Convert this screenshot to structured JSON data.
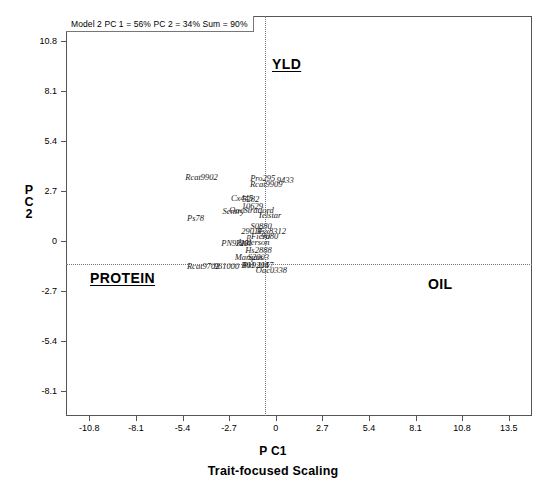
{
  "figure": {
    "model_annotation": "Model 2 PC 1 = 56% PC 2 = 34% Sum = 90%",
    "xlabel": "P C1",
    "scaling_label": "Trait-focused Scaling",
    "ylabel_line1": "P",
    "ylabel_line2": "C",
    "ylabel_line3": "2"
  },
  "traits": {
    "yld": "YLD",
    "protein": "PROTEIN",
    "oil": "OIL"
  },
  "chart_data": {
    "type": "scatter",
    "title": "Model 2 PC 1 = 56% PC 2 = 34% Sum = 90%",
    "xlabel": "P C1",
    "ylabel": "P C 2",
    "subtitle": "Trait-focused Scaling",
    "xlim": [
      -12.15,
      14.85
    ],
    "ylim": [
      -9.45,
      12.15
    ],
    "xticks": [
      -10.8,
      -8.1,
      -5.4,
      -2.7,
      0,
      2.7,
      5.4,
      8.1,
      10.8,
      13.5
    ],
    "yticks": [
      -8.1,
      -5.4,
      -2.7,
      0,
      2.7,
      5.4,
      8.1,
      10.8
    ],
    "xtick_labels": [
      "-10.8",
      "-8.1",
      "-5.4",
      "-2.7",
      "0",
      "2.7",
      "5.4",
      "8.1",
      "10.8",
      "13.5"
    ],
    "ytick_labels": [
      "-8.1",
      "-5.4",
      "-2.7",
      "0",
      "2.7",
      "5.4",
      "8.1",
      "10.8"
    ],
    "grid": false,
    "reference_lines": {
      "x": 0,
      "y": 0,
      "style": "dotted"
    },
    "legend": "none",
    "annotations": [
      {
        "text": "YLD",
        "x": 0.4,
        "y": 10.0,
        "underlined": true
      },
      {
        "text": "PROTEIN",
        "x": -8.8,
        "y": -1.5,
        "underlined": true
      },
      {
        "text": "OIL",
        "x": 10.6,
        "y": -1.8,
        "underlined": false
      }
    ],
    "point_label_style": "italic-serif",
    "points": [
      {
        "label": "Rcat9902",
        "x": -4.3,
        "y": 3.45
      },
      {
        "label": "Pro295",
        "x": -0.75,
        "y": 3.4
      },
      {
        "label": "9433",
        "x": 0.55,
        "y": 3.3
      },
      {
        "label": "Rcat9909",
        "x": -0.55,
        "y": 3.1
      },
      {
        "label": "Cx445",
        "x": -1.95,
        "y": 2.3
      },
      {
        "label": "5282",
        "x": -1.45,
        "y": 2.25
      },
      {
        "label": "10629",
        "x": -1.35,
        "y": 1.9
      },
      {
        "label": "Sentry",
        "x": -2.45,
        "y": 1.6
      },
      {
        "label": "OacStratford",
        "x": -1.4,
        "y": 1.65
      },
      {
        "label": "Telstar",
        "x": -0.35,
        "y": 1.4
      },
      {
        "label": "Ps78",
        "x": -4.65,
        "y": 1.25
      },
      {
        "label": "S0880",
        "x": -0.85,
        "y": 0.8
      },
      {
        "label": "2901F",
        "x": -1.35,
        "y": 0.55
      },
      {
        "label": "Rsx8312",
        "x": -0.25,
        "y": 0.55
      },
      {
        "label": "pFiera",
        "x": -1.0,
        "y": 0.25
      },
      {
        "label": "9080",
        "x": -0.35,
        "y": 0.25
      },
      {
        "label": "PN9313",
        "x": -2.35,
        "y": -0.1
      },
      {
        "label": "1201",
        "x": -1.85,
        "y": -0.12
      },
      {
        "label": "Anderson",
        "x": -1.3,
        "y": -0.08
      },
      {
        "label": "Hs2888",
        "x": -1.0,
        "y": -0.5
      },
      {
        "label": "Marquis",
        "x": -1.55,
        "y": -0.85
      },
      {
        "label": "S2003",
        "x": -1.0,
        "y": -0.85
      },
      {
        "label": "Rcat9702",
        "x": -4.2,
        "y": -1.35
      },
      {
        "label": "961000",
        "x": -2.85,
        "y": -1.35
      },
      {
        "label": "B01",
        "x": -1.6,
        "y": -1.3
      },
      {
        "label": "Pk9204",
        "x": -1.15,
        "y": -1.3
      },
      {
        "label": "1157",
        "x": -0.6,
        "y": -1.3
      },
      {
        "label": "Oac0338",
        "x": -0.25,
        "y": -1.55
      }
    ]
  }
}
